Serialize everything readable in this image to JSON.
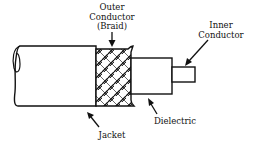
{
  "diagram": {
    "title": "",
    "labels": {
      "outer_conductor": {
        "line1": "Outer",
        "line2": "Conductor",
        "line3": "(Braid)"
      },
      "inner_conductor": {
        "line1": "Inner",
        "line2": "Conductor"
      },
      "jacket": {
        "line1": "Jacket"
      },
      "dielectric": {
        "line1": "Dielectric"
      }
    },
    "layers": [
      "Jacket",
      "Outer Conductor (Braid)",
      "Dielectric",
      "Inner Conductor"
    ],
    "colors": {
      "ink": "#111111",
      "background": "#ffffff"
    }
  }
}
